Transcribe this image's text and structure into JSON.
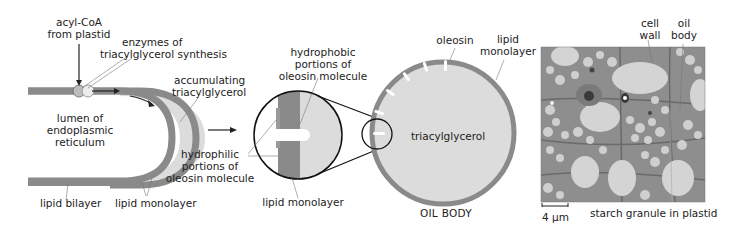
{
  "panels": {
    "er": {
      "labels": {
        "acyl_coa": [
          "acyl-CoA",
          "from plastid"
        ],
        "enzymes": [
          "enzymes of",
          "triacylglycerol synthesis"
        ],
        "accumulating": [
          "accumulating",
          "triacylglycerol"
        ],
        "lumen": [
          "lumen of",
          "endoplasmic",
          "reticulum"
        ],
        "lipid_bilayer": "lipid bilayer",
        "lipid_monolayer": "lipid monolayer"
      }
    },
    "zoom": {
      "labels": {
        "hydrophobic": [
          "hydrophobic",
          "portions of",
          "oleosin molecule"
        ],
        "hydrophilic": [
          "hydrophilic",
          "portions of",
          "oleosin molecule"
        ],
        "lipid_monolayer": "lipid monolayer"
      }
    },
    "oil_body": {
      "labels": {
        "oleosin": "oleosin",
        "lipid_monolayer": [
          "lipid",
          "monolayer"
        ],
        "triacylglycerol": "triacylglycerol",
        "title": "OIL BODY"
      }
    },
    "micrograph": {
      "labels": {
        "cell_wall": [
          "cell",
          "wall"
        ],
        "oil_body": [
          "oil",
          "body"
        ],
        "starch": "starch granule in plastid",
        "scale_bar": "4 µm"
      }
    }
  },
  "colors": {
    "membrane": "#8a8a8a",
    "triacylglycerol": "#dcdcdc",
    "outline": "#111111",
    "leader": "#777777",
    "micrograph_bg": "#9a9a9a",
    "micrograph_blob": "#d6d6d6"
  }
}
